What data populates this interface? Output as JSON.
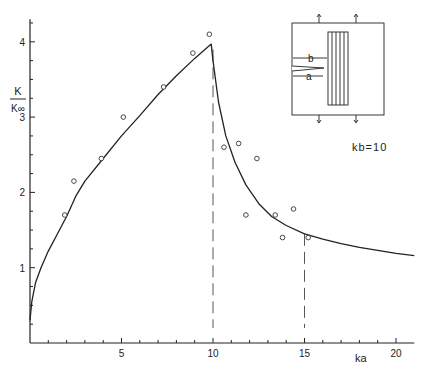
{
  "chart_data": {
    "type": "line",
    "title": "",
    "xlabel": "ka",
    "ylabel_num": "K",
    "ylabel_den": "K∞",
    "xlim": [
      0,
      21
    ],
    "ylim": [
      0,
      4.3
    ],
    "xticks": [
      5,
      10,
      15,
      20
    ],
    "yticks": [
      1,
      2,
      3,
      4
    ],
    "grid": false,
    "annotation": "kb=10",
    "reference_lines_x": [
      10,
      15
    ],
    "series": [
      {
        "name": "theory",
        "kind": "line",
        "points": [
          [
            0,
            0.3
          ],
          [
            0.1,
            0.55
          ],
          [
            0.3,
            0.8
          ],
          [
            0.6,
            1.0
          ],
          [
            1,
            1.22
          ],
          [
            1.5,
            1.45
          ],
          [
            2,
            1.68
          ],
          [
            2.5,
            1.95
          ],
          [
            3,
            2.15
          ],
          [
            4,
            2.45
          ],
          [
            5,
            2.75
          ],
          [
            6,
            3.02
          ],
          [
            7,
            3.3
          ],
          [
            8,
            3.55
          ],
          [
            9,
            3.78
          ],
          [
            9.9,
            3.97
          ],
          [
            10,
            3.75
          ],
          [
            10.3,
            3.2
          ],
          [
            10.7,
            2.75
          ],
          [
            11.2,
            2.4
          ],
          [
            11.8,
            2.1
          ],
          [
            12.5,
            1.85
          ],
          [
            13.2,
            1.68
          ],
          [
            14,
            1.56
          ],
          [
            15,
            1.45
          ],
          [
            16,
            1.38
          ],
          [
            17,
            1.32
          ],
          [
            18,
            1.27
          ],
          [
            19,
            1.23
          ],
          [
            20,
            1.19
          ],
          [
            21,
            1.16
          ]
        ]
      },
      {
        "name": "experiment",
        "kind": "scatter",
        "points": [
          [
            1.9,
            1.7
          ],
          [
            2.4,
            2.15
          ],
          [
            3.9,
            2.45
          ],
          [
            5.1,
            3.0
          ],
          [
            7.3,
            3.4
          ],
          [
            8.9,
            3.85
          ],
          [
            9.8,
            4.1
          ],
          [
            10.6,
            2.6
          ],
          [
            11.4,
            2.65
          ],
          [
            12.4,
            2.45
          ],
          [
            11.8,
            1.7
          ],
          [
            13.4,
            1.7
          ],
          [
            14.4,
            1.78
          ],
          [
            13.8,
            1.4
          ],
          [
            15.2,
            1.4
          ]
        ]
      }
    ],
    "inset": {
      "label_b": "b",
      "label_a": "a"
    }
  }
}
